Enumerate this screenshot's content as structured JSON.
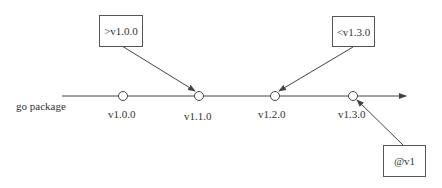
{
  "timeline": {
    "label": "go package",
    "versions": [
      {
        "label": "v1.0.0",
        "x": 123
      },
      {
        "label": "v1.1.0",
        "x": 199
      },
      {
        "label": "v1.2.0",
        "x": 275
      },
      {
        "label": "v1.3.0",
        "x": 353
      }
    ]
  },
  "constraints": [
    {
      "label": ">v1.0.0",
      "points_to": "v1.1.0"
    },
    {
      "label": "<v1.3.0",
      "points_to": "v1.2.0"
    },
    {
      "label": "@v1",
      "points_to": "v1.3.0"
    }
  ],
  "colors": {
    "line": "#444444",
    "box_border": "#555555",
    "text": "#333333"
  }
}
